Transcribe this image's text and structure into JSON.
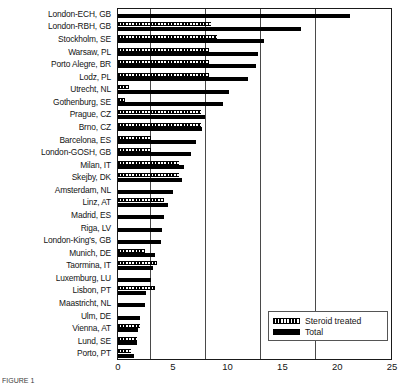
{
  "figure": {
    "caption": "FIGURE 1"
  },
  "legend": {
    "position": "bottom-right",
    "items": [
      {
        "label": "Steroid treated",
        "swatch": "hatched-bar-swatch"
      },
      {
        "label": "Total",
        "swatch": "solid-bar-swatch"
      }
    ]
  },
  "axis": {
    "xticks": [
      "0",
      "5",
      "10",
      "15",
      "20",
      "25"
    ],
    "xlim": [
      0,
      25
    ]
  },
  "chart_data": {
    "type": "bar",
    "orientation": "horizontal",
    "title": "",
    "xlabel": "",
    "ylabel": "",
    "xlim": [
      0,
      25
    ],
    "ylim": [
      0,
      26
    ],
    "grid": true,
    "grid_axis": "x",
    "legend_position": "bottom-right",
    "xticks": [
      0,
      5,
      10,
      15,
      20,
      25
    ],
    "categories": [
      "London-ECH, GB",
      "London-RBH, GB",
      "Stockholm, SE",
      "Warsaw, PL",
      "Porto Alegre, BR",
      "Lodz, PL",
      "Utrecht, NL",
      "Gothenburg, SE",
      "Prague, CZ",
      "Brno, CZ",
      "Barcelona, ES",
      "London-GOSH, GB",
      "Milan, IT",
      "Skejby, DK",
      "Amsterdam, NL",
      "Linz, AT",
      "Madrid, ES",
      "Riga, LV",
      "London-King's, GB",
      "Munich, DE",
      "Taormina, IT",
      "Luxemburg, LU",
      "Lisbon, PT",
      "Maastricht, NL",
      "Ulm, DE",
      "Vienna, AT",
      "Lund, SE",
      "Porto, PT"
    ],
    "series": [
      {
        "name": "Steroid treated",
        "pattern": "hatched",
        "values": [
          0.0,
          8.5,
          9.0,
          8.3,
          8.3,
          8.3,
          1.0,
          0.6,
          7.6,
          7.6,
          3.0,
          3.0,
          5.6,
          5.6,
          0.0,
          4.2,
          0.0,
          0.0,
          0.0,
          2.5,
          3.6,
          0.0,
          3.4,
          0.0,
          0.0,
          2.0,
          1.7,
          1.2
        ]
      },
      {
        "name": "Total",
        "pattern": "solid",
        "values": [
          21.2,
          16.7,
          13.3,
          12.8,
          12.6,
          11.9,
          10.1,
          9.6,
          7.9,
          7.7,
          7.1,
          6.7,
          6.0,
          5.8,
          5.0,
          4.6,
          4.2,
          4.0,
          3.9,
          3.4,
          3.2,
          3.0,
          2.6,
          2.5,
          2.0,
          1.8,
          1.7,
          1.5
        ]
      }
    ]
  }
}
